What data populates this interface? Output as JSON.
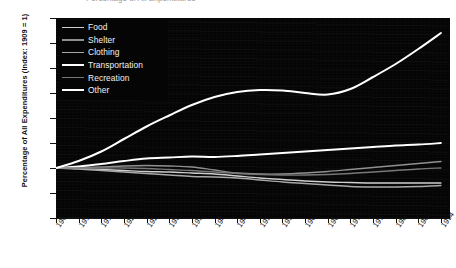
{
  "chart_data": {
    "type": "line",
    "title": "",
    "xlabel": "",
    "ylabel": "Percentage of All Expenditures (Index: 1909 = 1)",
    "xlim": [
      1909,
      1996
    ],
    "ylim": [
      0.0,
      4.0
    ],
    "grid": false,
    "legend_position": "upper-left",
    "background": "#050505",
    "x": [
      1909,
      1914,
      1919,
      1924,
      1929,
      1934,
      1939,
      1944,
      1949,
      1954,
      1959,
      1964,
      1969,
      1974,
      1979,
      1984,
      1989,
      1994
    ],
    "yticks": [
      "0.0",
      "0.5",
      "1.0",
      "1.5",
      "2.0",
      "2.5",
      "3.0",
      "3.5",
      "4.0"
    ],
    "xticks": [
      "1909",
      "1914",
      "1919",
      "1924",
      "1929",
      "1934",
      "1939",
      "1944",
      "1949",
      "1954",
      "1959",
      "1964",
      "1969",
      "1974",
      "1979",
      "1984",
      "1989",
      "1994"
    ],
    "series": [
      {
        "name": "Food",
        "color": "#cfcfcf",
        "width": 1.4,
        "values": [
          1.0,
          0.99,
          0.97,
          0.95,
          0.93,
          0.92,
          0.9,
          0.88,
          0.84,
          0.8,
          0.77,
          0.74,
          0.72,
          0.71,
          0.7,
          0.7,
          0.7,
          0.7
        ]
      },
      {
        "name": "Shelter",
        "color": "#8f8f8f",
        "width": 1.4,
        "values": [
          1.0,
          1.01,
          1.02,
          1.04,
          1.05,
          1.04,
          1.02,
          0.96,
          0.9,
          0.88,
          0.88,
          0.9,
          0.93,
          0.97,
          1.01,
          1.05,
          1.09,
          1.13
        ]
      },
      {
        "name": "Clothing",
        "color": "#a8a8a8",
        "width": 1.4,
        "values": [
          1.0,
          0.98,
          0.95,
          0.92,
          0.89,
          0.86,
          0.83,
          0.82,
          0.8,
          0.76,
          0.72,
          0.69,
          0.66,
          0.63,
          0.62,
          0.62,
          0.63,
          0.65
        ]
      },
      {
        "name": "Transportation",
        "color": "#ffffff",
        "width": 1.8,
        "values": [
          1.0,
          1.03,
          1.08,
          1.14,
          1.19,
          1.21,
          1.23,
          1.22,
          1.24,
          1.27,
          1.3,
          1.33,
          1.36,
          1.39,
          1.42,
          1.45,
          1.47,
          1.5
        ]
      },
      {
        "name": "Recreation",
        "color": "#777777",
        "width": 1.3,
        "values": [
          1.0,
          1.0,
          1.0,
          1.0,
          0.99,
          0.97,
          0.95,
          0.92,
          0.89,
          0.87,
          0.86,
          0.86,
          0.87,
          0.89,
          0.92,
          0.95,
          0.98,
          1.0
        ]
      },
      {
        "name": "Other",
        "color": "#ffffff",
        "width": 2.0,
        "values": [
          1.0,
          1.14,
          1.33,
          1.58,
          1.83,
          2.05,
          2.26,
          2.42,
          2.52,
          2.56,
          2.55,
          2.5,
          2.47,
          2.58,
          2.82,
          3.08,
          3.38,
          3.7
        ]
      }
    ]
  },
  "top_fragment": "Percentage of All Expenditures"
}
